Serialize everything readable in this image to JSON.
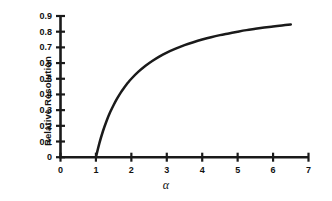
{
  "chart_data": {
    "type": "line",
    "title": "",
    "subtitle": "",
    "xlabel": "α",
    "ylabel": "Relative Resolution",
    "xlim": [
      0,
      7
    ],
    "ylim": [
      0,
      0.9
    ],
    "grid": false,
    "legend": null,
    "legend_position": "none",
    "x_ticks": [
      "0",
      "1",
      "2",
      "3",
      "4",
      "5",
      "6",
      "7"
    ],
    "x_tick_values": [
      0,
      1,
      2,
      3,
      4,
      5,
      6,
      7
    ],
    "y_ticks": [
      "0",
      "0.1",
      "0.2",
      "0.3",
      "0.4",
      "0.5",
      "0.6",
      "0.7",
      "0.8",
      "0.9"
    ],
    "y_tick_values": [
      0,
      0.1,
      0.2,
      0.3,
      0.4,
      0.5,
      0.6,
      0.7,
      0.8,
      0.9
    ],
    "series": [
      {
        "name": "Relative Resolution",
        "color": "#1a1a1a",
        "x": [
          1.0,
          1.1,
          1.2,
          1.3,
          1.4,
          1.5,
          1.6,
          1.7,
          1.8,
          1.9,
          2.0,
          2.2,
          2.4,
          2.6,
          2.8,
          3.0,
          3.25,
          3.5,
          3.75,
          4.0,
          4.25,
          4.5,
          4.75,
          5.0,
          5.25,
          5.5,
          5.75,
          6.0,
          6.25,
          6.5
        ],
        "values": [
          0.0,
          0.091,
          0.167,
          0.231,
          0.286,
          0.333,
          0.375,
          0.412,
          0.444,
          0.474,
          0.5,
          0.545,
          0.583,
          0.615,
          0.643,
          0.667,
          0.692,
          0.714,
          0.733,
          0.75,
          0.765,
          0.778,
          0.789,
          0.8,
          0.81,
          0.818,
          0.826,
          0.833,
          0.84,
          0.846
        ]
      }
    ],
    "annotations": []
  },
  "axis": {
    "y_axis_label": "Relative Resolution",
    "x_axis_label": "α",
    "y_tick_labels": [
      "0.9",
      "0.8",
      "0.7",
      "0.6",
      "0.5",
      "0.4",
      "0.3",
      "0.2",
      "0.1",
      "0"
    ],
    "x_tick_labels": [
      "0",
      "1",
      "2",
      "3",
      "4",
      "5",
      "6",
      "7"
    ]
  }
}
